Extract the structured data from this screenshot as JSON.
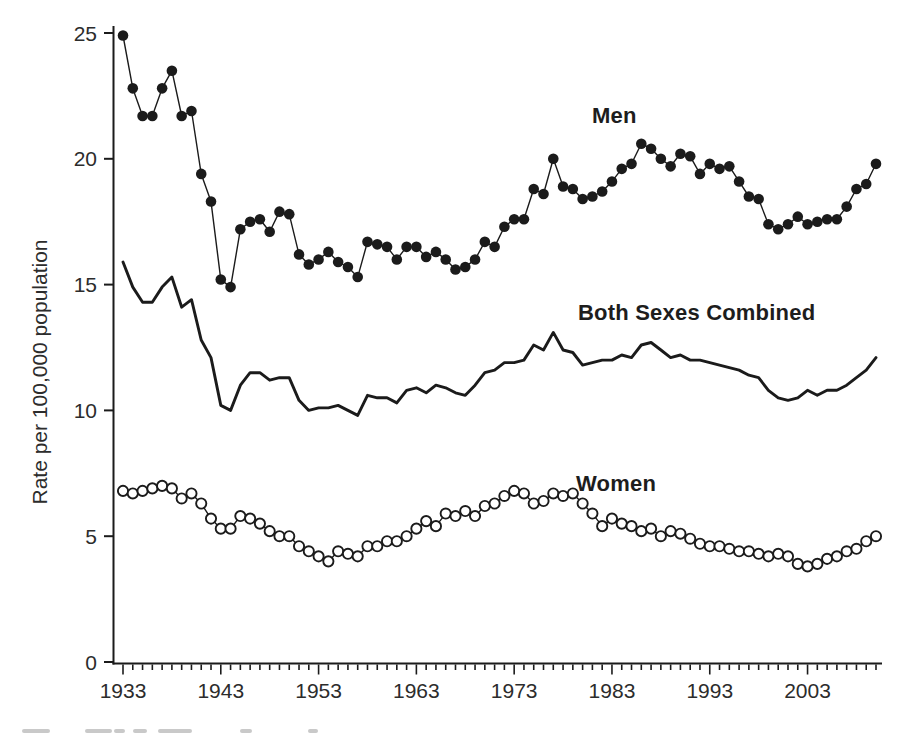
{
  "figure": {
    "y_axis_title": "Rate per 100,000 population",
    "background_color": "#ffffff",
    "ink_color": "#1b1b1b",
    "tick_text_color": "#2c2c2c"
  },
  "chart_data": {
    "type": "line",
    "title": "",
    "xlabel": "",
    "ylabel": "Rate per 100,000 population",
    "ylim": [
      0,
      25
    ],
    "grid": false,
    "legend_position": "inline-labels-on-plot",
    "y_tick_labels": [
      0,
      5,
      10,
      15,
      20,
      25
    ],
    "x_tick_labels": [
      1933,
      1943,
      1953,
      1963,
      1973,
      1983,
      1993,
      2003
    ],
    "x_minor_ticks": "every year 1933-2010",
    "years": [
      1933,
      1934,
      1935,
      1936,
      1937,
      1938,
      1939,
      1940,
      1941,
      1942,
      1943,
      1944,
      1945,
      1946,
      1947,
      1948,
      1949,
      1950,
      1951,
      1952,
      1953,
      1954,
      1955,
      1956,
      1957,
      1958,
      1959,
      1960,
      1961,
      1962,
      1963,
      1964,
      1965,
      1966,
      1967,
      1968,
      1969,
      1970,
      1971,
      1972,
      1973,
      1974,
      1975,
      1976,
      1977,
      1978,
      1979,
      1980,
      1981,
      1982,
      1983,
      1984,
      1985,
      1986,
      1987,
      1988,
      1989,
      1990,
      1991,
      1992,
      1993,
      1994,
      1995,
      1996,
      1997,
      1998,
      1999,
      2000,
      2001,
      2002,
      2003,
      2004,
      2005,
      2006,
      2007,
      2008,
      2009,
      2010
    ],
    "series": [
      {
        "name": "Men",
        "marker": "filled-circle",
        "line_style": "thin-solid",
        "color": "#1b1b1b",
        "values": [
          24.9,
          22.8,
          21.7,
          21.7,
          22.8,
          23.5,
          21.7,
          21.9,
          19.4,
          18.3,
          15.2,
          14.9,
          17.2,
          17.5,
          17.6,
          17.1,
          17.9,
          17.8,
          16.2,
          15.8,
          16.0,
          16.3,
          15.9,
          15.7,
          15.3,
          16.7,
          16.6,
          16.5,
          16.0,
          16.5,
          16.5,
          16.1,
          16.3,
          16.0,
          15.6,
          15.7,
          16.0,
          16.7,
          16.5,
          17.3,
          17.6,
          17.6,
          18.8,
          18.6,
          20.0,
          18.9,
          18.8,
          18.4,
          18.5,
          18.7,
          19.1,
          19.6,
          19.8,
          20.6,
          20.4,
          20.0,
          19.7,
          20.2,
          20.1,
          19.4,
          19.8,
          19.6,
          19.7,
          19.1,
          18.5,
          18.4,
          17.4,
          17.2,
          17.4,
          17.7,
          17.4,
          17.5,
          17.6,
          17.6,
          18.1,
          18.8,
          19.0,
          19.8
        ]
      },
      {
        "name": "Both Sexes Combined",
        "marker": "none",
        "line_style": "thick-solid",
        "color": "#1b1b1b",
        "values": [
          15.9,
          14.9,
          14.3,
          14.3,
          14.9,
          15.3,
          14.1,
          14.4,
          12.8,
          12.1,
          10.2,
          10.0,
          11.0,
          11.5,
          11.5,
          11.2,
          11.3,
          11.3,
          10.4,
          10.0,
          10.1,
          10.1,
          10.2,
          10.0,
          9.8,
          10.6,
          10.5,
          10.5,
          10.3,
          10.8,
          10.9,
          10.7,
          11.0,
          10.9,
          10.7,
          10.6,
          11.0,
          11.5,
          11.6,
          11.9,
          11.9,
          12.0,
          12.6,
          12.4,
          13.1,
          12.4,
          12.3,
          11.8,
          11.9,
          12.0,
          12.0,
          12.2,
          12.1,
          12.6,
          12.7,
          12.4,
          12.1,
          12.2,
          12.0,
          12.0,
          11.9,
          11.8,
          11.7,
          11.6,
          11.4,
          11.3,
          10.8,
          10.5,
          10.4,
          10.5,
          10.8,
          10.6,
          10.8,
          10.8,
          11.0,
          11.3,
          11.6,
          12.1
        ]
      },
      {
        "name": "Women",
        "marker": "open-circle",
        "line_style": "thin-solid",
        "color": "#1b1b1b",
        "values": [
          6.8,
          6.7,
          6.8,
          6.9,
          7.0,
          6.9,
          6.5,
          6.7,
          6.3,
          5.7,
          5.3,
          5.3,
          5.8,
          5.7,
          5.5,
          5.2,
          5.0,
          5.0,
          4.6,
          4.4,
          4.2,
          4.0,
          4.4,
          4.3,
          4.2,
          4.6,
          4.6,
          4.8,
          4.8,
          5.0,
          5.3,
          5.6,
          5.4,
          5.9,
          5.8,
          6.0,
          5.8,
          6.2,
          6.3,
          6.6,
          6.8,
          6.7,
          6.3,
          6.4,
          6.7,
          6.6,
          6.7,
          6.3,
          5.9,
          5.4,
          5.7,
          5.5,
          5.4,
          5.2,
          5.3,
          5.0,
          5.2,
          5.1,
          4.9,
          4.7,
          4.6,
          4.6,
          4.5,
          4.4,
          4.4,
          4.3,
          4.2,
          4.3,
          4.2,
          3.9,
          3.8,
          3.9,
          4.1,
          4.2,
          4.4,
          4.5,
          4.8,
          5.0
        ]
      }
    ]
  }
}
